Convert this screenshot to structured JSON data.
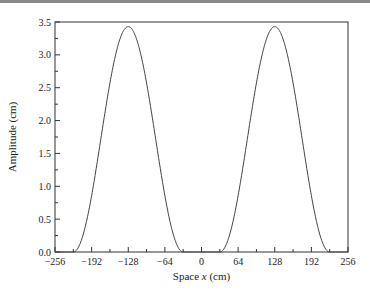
{
  "chart_data": {
    "type": "line",
    "title": "",
    "xlabel": "Space x (cm)",
    "xlabel_parts": {
      "prefix": "Space ",
      "var": "x",
      "suffix": " (cm)"
    },
    "ylabel": "Amplitude (cm)",
    "xlim": [
      -256,
      256
    ],
    "ylim": [
      0,
      3.5
    ],
    "xticks": [
      -256,
      -192,
      -128,
      -64,
      0,
      64,
      128,
      192,
      256
    ],
    "xtick_labels": [
      "−256",
      "−192",
      "−128",
      "−64",
      "0",
      "64",
      "128",
      "192",
      "256"
    ],
    "yticks": [
      0.0,
      0.5,
      1.0,
      1.5,
      2.0,
      2.5,
      3.0,
      3.5
    ],
    "ytick_labels": [
      "0.0",
      "0.5",
      "1.0",
      "1.5",
      "2.0",
      "2.5",
      "3.0",
      "3.5"
    ],
    "grid": false,
    "legend": null,
    "series": [
      {
        "name": "amplitude",
        "color": "#444444",
        "x": [
          -256,
          -224,
          -208,
          -192,
          -176,
          -160,
          -144,
          -128,
          -112,
          -96,
          -80,
          -64,
          -48,
          -32,
          0,
          32,
          48,
          64,
          80,
          96,
          112,
          128,
          144,
          160,
          176,
          192,
          208,
          224,
          256
        ],
        "y": [
          0.0,
          0.0,
          0.23,
          0.86,
          1.72,
          2.57,
          3.2,
          3.43,
          3.2,
          2.57,
          1.72,
          0.86,
          0.23,
          0.0,
          0.0,
          0.0,
          0.23,
          0.86,
          1.72,
          2.57,
          3.2,
          3.43,
          3.2,
          2.57,
          1.72,
          0.86,
          0.23,
          0.0,
          0.0
        ]
      }
    ],
    "peaks": [
      {
        "x": -128,
        "y": 3.43
      },
      {
        "x": 128,
        "y": 3.43
      }
    ]
  }
}
